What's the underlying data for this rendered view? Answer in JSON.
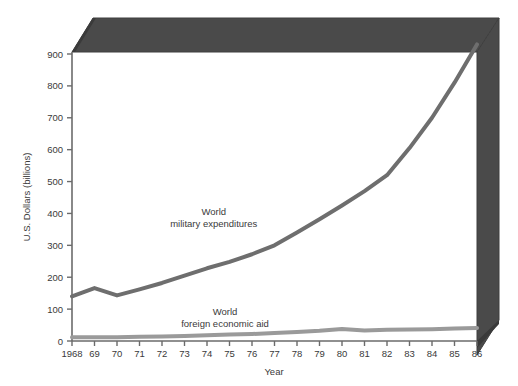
{
  "chart_data": {
    "type": "line",
    "title": "",
    "xlabel": "Year",
    "ylabel": "U.S. Dollars (billions)",
    "xlim": [
      1968,
      1986
    ],
    "ylim": [
      0,
      950
    ],
    "yticks": [
      0,
      100,
      200,
      300,
      400,
      500,
      600,
      700,
      800,
      900
    ],
    "ytick_labels": [
      "0",
      "100",
      "200",
      "300",
      "400",
      "500",
      "600",
      "700",
      "800",
      "900"
    ],
    "x": [
      1968,
      1969,
      1970,
      1971,
      1972,
      1973,
      1974,
      1975,
      1976,
      1977,
      1978,
      1979,
      1980,
      1981,
      1982,
      1983,
      1984,
      1985,
      1986
    ],
    "xtick_labels": [
      "1968",
      "69",
      "70",
      "71",
      "72",
      "73",
      "74",
      "75",
      "76",
      "77",
      "78",
      "79",
      "80",
      "81",
      "82",
      "83",
      "84",
      "85",
      "86"
    ],
    "grid": false,
    "legend_position": "inline-annotations",
    "series": [
      {
        "name": "World military expenditures",
        "color": "#6e6e6e",
        "line_width": 4,
        "values": [
          140,
          166,
          143,
          162,
          182,
          205,
          228,
          248,
          272,
          300,
          340,
          382,
          425,
          470,
          520,
          605,
          700,
          810,
          930
        ],
        "annotation": {
          "line1": "World",
          "line2": "military expenditures",
          "x": 1974.3,
          "y": 395
        }
      },
      {
        "name": "World foreign economic aid",
        "color": "#9a9a9a",
        "line_width": 4,
        "values": [
          12,
          12,
          12,
          13,
          14,
          16,
          18,
          20,
          22,
          25,
          28,
          32,
          38,
          33,
          35,
          36,
          37,
          39,
          41
        ],
        "annotation": {
          "line1": "World",
          "line2": "foreign economic aid",
          "x": 1974.8,
          "y": 82
        }
      }
    ]
  },
  "style": {
    "axis_color": "#6b6b6b",
    "slab_color": "#4a4a4a",
    "slab_bevel_color": "#3c3c3c",
    "background": "#ffffff",
    "text_color": "#3a3a3a"
  },
  "icons": {
    "none": ""
  }
}
